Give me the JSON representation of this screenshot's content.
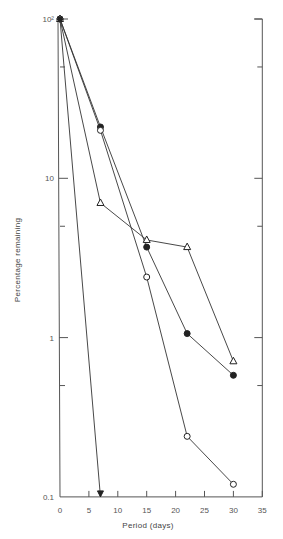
{
  "chart_data": {
    "type": "line",
    "title": "",
    "xlabel": "Period (days)",
    "ylabel": "Percentage remaining",
    "xlim": [
      0,
      35
    ],
    "ylim": [
      0.1,
      100
    ],
    "yscale": "log",
    "x_ticks": [
      0,
      5,
      10,
      15,
      20,
      25,
      30,
      35
    ],
    "x_tick_labels": [
      "0",
      "5",
      "10",
      "15",
      "20",
      "25",
      "30",
      "35"
    ],
    "y_ticks": [
      0.1,
      1,
      10,
      100
    ],
    "y_tick_labels": [
      "0.1",
      "1",
      "10",
      "10²"
    ],
    "y_minor_ticks": [
      0.5,
      5,
      50
    ],
    "grid": false,
    "legend": null,
    "series": [
      {
        "name": "filled-circle",
        "marker": "filled-circle",
        "x": [
          0,
          7,
          15,
          22,
          30
        ],
        "values": [
          100,
          21,
          3.7,
          1.06,
          0.58
        ]
      },
      {
        "name": "open-circle",
        "marker": "open-circle",
        "x": [
          0,
          7,
          15,
          22,
          30
        ],
        "values": [
          100,
          20,
          2.4,
          0.24,
          0.12
        ]
      },
      {
        "name": "open-triangle",
        "marker": "open-triangle",
        "x": [
          0,
          7,
          15,
          22,
          30
        ],
        "values": [
          100,
          7.0,
          4.1,
          3.7,
          0.71
        ]
      },
      {
        "name": "filled-triangle-down",
        "marker": "filled-triangle-down",
        "x": [
          0,
          7
        ],
        "values": [
          100,
          0.1
        ],
        "note": "drops below 0.1 by day 7"
      }
    ]
  }
}
